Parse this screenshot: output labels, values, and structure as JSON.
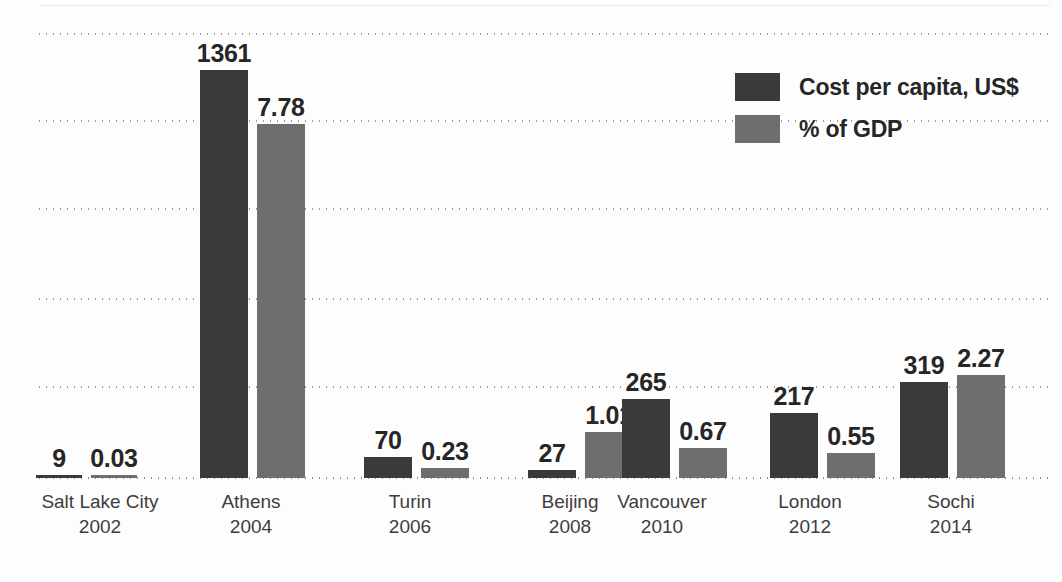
{
  "chart_data": {
    "type": "bar",
    "title": "",
    "subtitle": "",
    "xlabel": "",
    "ylabel": "",
    "grid": true,
    "gridlines_count": 5,
    "axis_tick_labels": [],
    "legend_position": "top-right",
    "categories": [
      "Salt Lake City",
      "Athens",
      "Turin",
      "Beijing",
      "Vancouver",
      "London",
      "Sochi"
    ],
    "years": [
      "2002",
      "2004",
      "2006",
      "2008",
      "2010",
      "2012",
      "2014"
    ],
    "series": [
      {
        "name": "Cost per capita, US$",
        "color": "#3a3a3a",
        "values": [
          9,
          1361,
          70,
          27,
          265,
          217,
          319
        ],
        "value_labels": [
          "9",
          "1361",
          "70",
          "27",
          "265",
          "217",
          "319"
        ]
      },
      {
        "name": "% of GDP",
        "color": "#6e6e6e",
        "values": [
          0.03,
          7.78,
          0.23,
          1.01,
          0.67,
          0.55,
          2.27
        ],
        "value_labels": [
          "0.03",
          "7.78",
          "0.23",
          "1.01",
          "0.67",
          "0.55",
          "2.27"
        ]
      }
    ]
  },
  "legend": {
    "items": [
      {
        "label": "Cost per capita, US$",
        "color": "#3a3a3a"
      },
      {
        "label": "% of GDP",
        "color": "#6e6e6e"
      }
    ]
  },
  "axis": {
    "categories": [
      {
        "city": "Salt Lake City",
        "year": "2002"
      },
      {
        "city": "Athens",
        "year": "2004"
      },
      {
        "city": "Turin",
        "year": "2006"
      },
      {
        "city": "Beijing",
        "year": "2008"
      },
      {
        "city": "Vancouver",
        "year": "2010"
      },
      {
        "city": "London",
        "year": "2012"
      },
      {
        "city": "Sochi",
        "year": "2014"
      }
    ]
  }
}
